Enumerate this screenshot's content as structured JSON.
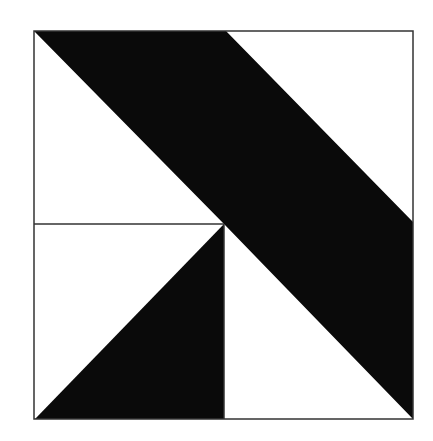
{
  "figure": {
    "colors": {
      "background": "#ffffff",
      "fill": "#0a0a0a",
      "stroke": "#333333"
    },
    "square": {
      "x1": 34,
      "y1": 31,
      "x2": 413,
      "y2": 419
    },
    "center": {
      "x": 224,
      "y": 224
    },
    "shapes": [
      {
        "name": "diagonal-band",
        "fill": "#0a0a0a",
        "points": "34,31 226,31 413,222 413,419 224,224"
      },
      {
        "name": "lower-left-triangle",
        "fill": "#0a0a0a",
        "points": "35,419 224,224 224,419"
      }
    ],
    "lines": [
      {
        "name": "horizontal-divider",
        "x1": 34,
        "y1": 224,
        "x2": 224,
        "y2": 224
      },
      {
        "name": "vertical-divider",
        "x1": 224,
        "y1": 224,
        "x2": 224,
        "y2": 419
      }
    ]
  },
  "top_text_fragment": "· ·  ·· ·"
}
